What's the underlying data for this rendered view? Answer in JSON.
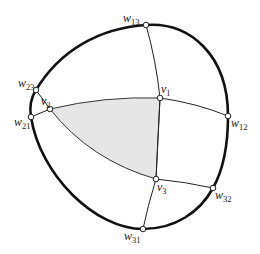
{
  "colors": {
    "outer": "#111111",
    "shaded": "#e6e6e6",
    "edge": "#222222"
  },
  "nodes": [
    {
      "id": "w13",
      "base": "w",
      "sub": "13"
    },
    {
      "id": "v1",
      "base": "v",
      "sub": "1"
    },
    {
      "id": "w12",
      "base": "w",
      "sub": "12"
    },
    {
      "id": "w23",
      "base": "w",
      "sub": "23"
    },
    {
      "id": "v2",
      "base": "v",
      "sub": "2"
    },
    {
      "id": "w21",
      "base": "w",
      "sub": "21"
    },
    {
      "id": "v3",
      "base": "v",
      "sub": "3"
    },
    {
      "id": "w32",
      "base": "w",
      "sub": "32"
    },
    {
      "id": "w31",
      "base": "w",
      "sub": "31"
    }
  ],
  "shaded_region": "triangle v1 v2 v3"
}
